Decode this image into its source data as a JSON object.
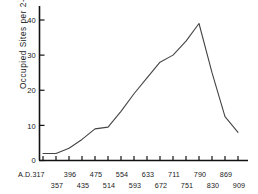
{
  "chart_data": {
    "type": "line",
    "title": "",
    "xlabel": "",
    "ylabel": "Occupied Sites per 2-Katun Period",
    "ylim": [
      0,
      44
    ],
    "yticks": [
      0,
      10,
      20,
      30,
      40
    ],
    "ytick_labels": [
      "0",
      "10",
      "20",
      "30",
      "40"
    ],
    "grid": false,
    "legend": null,
    "x_axis_label_rows": [
      [
        "A.D.317",
        "396",
        "475",
        "554",
        "633",
        "711",
        "790",
        "869"
      ],
      [
        "357",
        "435",
        "514",
        "593",
        "672",
        "751",
        "830",
        "909"
      ]
    ],
    "x_categories": [
      "A.D.317",
      "357",
      "396",
      "435",
      "475",
      "514",
      "554",
      "593",
      "633",
      "672",
      "711",
      "751",
      "790",
      "830",
      "869",
      "909"
    ],
    "values": [
      2,
      2,
      3.5,
      6,
      9,
      9.5,
      14,
      19,
      23.5,
      28,
      30,
      34,
      39,
      25,
      12.5,
      8
    ],
    "line_color": "#444444",
    "axis_color": "#111111"
  },
  "axis": {
    "y_label": "Occupied Sites per 2-Katun Period",
    "y_ticks": [
      "40",
      "30",
      "20",
      "10",
      "0"
    ],
    "x_row_top": [
      "A.D.317",
      "396",
      "475",
      "554",
      "633",
      "711",
      "790",
      "869"
    ],
    "x_row_bottom": [
      "357",
      "435",
      "514",
      "593",
      "672",
      "751",
      "830",
      "909"
    ]
  }
}
